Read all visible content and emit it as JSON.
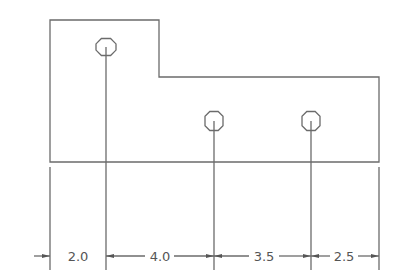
{
  "drawing": {
    "type": "engineering dimension drawing",
    "line_color": "#6b6b6b",
    "part_outline": "L-shaped plate with a raised left section",
    "holes": [
      {
        "id": "hole-1",
        "shape": "octagon"
      },
      {
        "id": "hole-2",
        "shape": "octagon"
      },
      {
        "id": "hole-3",
        "shape": "octagon"
      }
    ],
    "dimensions": [
      {
        "label": "2.0"
      },
      {
        "label": "4.0"
      },
      {
        "label": "3.5"
      },
      {
        "label": "2.5"
      }
    ]
  }
}
